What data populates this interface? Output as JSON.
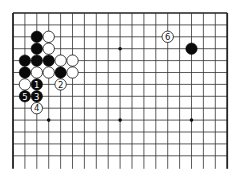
{
  "diagram": {
    "type": "go-board",
    "size": 19,
    "visible_rows": 13,
    "bottom_open": true,
    "origin": {
      "x": 13,
      "y": 13
    },
    "spacing": 11.9,
    "line_color": "#333333",
    "edge_color": "#222222",
    "star_points": [
      [
        3,
        3
      ],
      [
        9,
        3
      ],
      [
        15,
        3
      ],
      [
        3,
        9
      ],
      [
        9,
        9
      ],
      [
        15,
        9
      ]
    ],
    "stones": [
      {
        "col": 2,
        "row": 2,
        "color": "black",
        "label": ""
      },
      {
        "col": 3,
        "row": 2,
        "color": "white",
        "label": ""
      },
      {
        "col": 2,
        "row": 3,
        "color": "black",
        "label": ""
      },
      {
        "col": 3,
        "row": 3,
        "color": "white",
        "label": ""
      },
      {
        "col": 1,
        "row": 4,
        "color": "black",
        "label": ""
      },
      {
        "col": 2,
        "row": 4,
        "color": "black",
        "label": ""
      },
      {
        "col": 3,
        "row": 4,
        "color": "black",
        "label": ""
      },
      {
        "col": 4,
        "row": 4,
        "color": "white",
        "label": ""
      },
      {
        "col": 5,
        "row": 4,
        "color": "white",
        "label": ""
      },
      {
        "col": 1,
        "row": 5,
        "color": "black",
        "label": ""
      },
      {
        "col": 2,
        "row": 5,
        "color": "white",
        "label": ""
      },
      {
        "col": 3,
        "row": 5,
        "color": "white",
        "label": ""
      },
      {
        "col": 4,
        "row": 5,
        "color": "black",
        "label": ""
      },
      {
        "col": 5,
        "row": 5,
        "color": "white",
        "label": ""
      },
      {
        "col": 1,
        "row": 6,
        "color": "white",
        "label": ""
      },
      {
        "col": 2,
        "row": 6,
        "color": "black",
        "label": "1"
      },
      {
        "col": 4,
        "row": 6,
        "color": "white",
        "label": "2"
      },
      {
        "col": 2,
        "row": 7,
        "color": "black",
        "label": "3"
      },
      {
        "col": 2,
        "row": 8,
        "color": "white",
        "label": "4"
      },
      {
        "col": 1,
        "row": 7,
        "color": "black",
        "label": "5"
      },
      {
        "col": 13,
        "row": 2,
        "color": "white",
        "label": "6"
      },
      {
        "col": 15,
        "row": 3,
        "color": "black",
        "label": ""
      }
    ]
  }
}
